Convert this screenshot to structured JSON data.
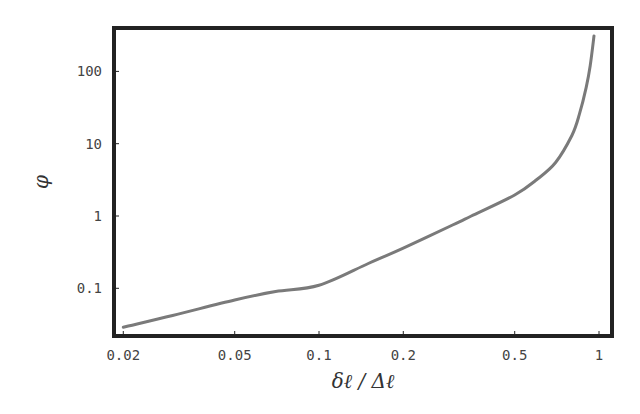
{
  "chart_data": {
    "type": "line",
    "title": "",
    "xlabel": "δℓ / Δℓ",
    "ylabel": "φ",
    "xscale": "log",
    "yscale": "log",
    "xlim": [
      0.018,
      1.05
    ],
    "ylim": [
      0.025,
      400
    ],
    "grid": false,
    "legend": null,
    "x_ticks": [
      0.02,
      0.05,
      0.1,
      0.2,
      0.5,
      1
    ],
    "x_tick_labels": [
      "0.02",
      "0.05",
      "0.1",
      "0.2",
      "0.5",
      "1"
    ],
    "y_ticks": [
      0.1,
      1,
      10,
      100
    ],
    "y_tick_labels": [
      "0.1",
      "1",
      "10",
      "100"
    ],
    "series": [
      {
        "name": "phi",
        "color": "#7a7a7a",
        "x": [
          0.02,
          0.03,
          0.05,
          0.07,
          0.1,
          0.15,
          0.2,
          0.3,
          0.35,
          0.5,
          0.6,
          0.7,
          0.8,
          0.85,
          0.9,
          0.93,
          0.96
        ],
        "y": [
          0.029,
          0.042,
          0.069,
          0.09,
          0.11,
          0.22,
          0.36,
          0.75,
          1.0,
          1.95,
          3.2,
          5.5,
          13,
          25,
          60,
          120,
          310
        ]
      }
    ]
  },
  "axes": {
    "xlabel": "δℓ / Δℓ",
    "ylabel": "φ"
  }
}
